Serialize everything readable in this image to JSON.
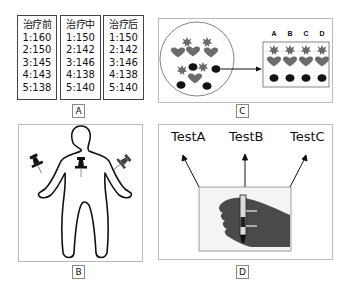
{
  "panel_a": {
    "label": "A",
    "columns": [
      {
        "header": "治疗前",
        "rows": [
          "1:160",
          "2:150",
          "3:145",
          "4:143",
          "5:138"
        ]
      },
      {
        "header": "治疗中",
        "rows": [
          "1:150",
          "2:142",
          "3:146",
          "4:138",
          "5:140"
        ]
      },
      {
        "header": "治疗后",
        "rows": [
          "1:150",
          "2:142",
          "3:146",
          "4:138",
          "5:140"
        ]
      }
    ]
  },
  "panel_b": {
    "label": "B",
    "figure": "human-body-outline-with-three-pushpins"
  },
  "panel_c": {
    "label": "C",
    "column_headers": [
      "A",
      "B",
      "C",
      "D"
    ],
    "row_shapes": [
      "star",
      "heart",
      "ellipse"
    ],
    "mixed_group_shapes": [
      "star",
      "star",
      "heart",
      "heart",
      "heart",
      "star",
      "ellipse",
      "star",
      "ellipse",
      "heart",
      "ellipse",
      "ellipse"
    ]
  },
  "panel_d": {
    "label": "D",
    "tests": [
      "TestA",
      "TestB",
      "TestC"
    ],
    "photo": "gloved-hand-holding-test-tube"
  },
  "colors": {
    "border": "#444444",
    "panel_border": "#bbbbbb",
    "shape_gray": "#6b6b6b",
    "shape_black": "#111111"
  }
}
